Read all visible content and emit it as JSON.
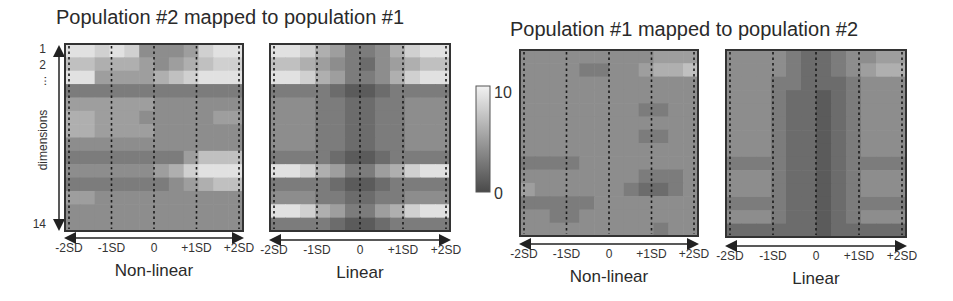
{
  "chart_data": [
    {
      "type": "heatmap",
      "group_title": "Population #2 mapped to population #1",
      "title": "Non-linear",
      "xlabel": "Non-linear",
      "ylabel": "dimensions",
      "x_tick_labels": [
        "-2SD",
        "-1SD",
        "0",
        "+1SD",
        "+2SD"
      ],
      "y_tick_labels": [
        "1",
        "2",
        "...",
        "14"
      ],
      "color_range": [
        0,
        10
      ],
      "rows": 14,
      "cols": 12,
      "values": [
        [
          9,
          9,
          8,
          9,
          8,
          4,
          4,
          4,
          5,
          8,
          9,
          9
        ],
        [
          7,
          7,
          6,
          6,
          6,
          5,
          4,
          5,
          6,
          7,
          8,
          8
        ],
        [
          9,
          9,
          5,
          5,
          5,
          5,
          6,
          7,
          8,
          9,
          9,
          9
        ],
        [
          3,
          3,
          3,
          3,
          3,
          3,
          3,
          3,
          3,
          3,
          3,
          3
        ],
        [
          5,
          5,
          5,
          5,
          5,
          5,
          4,
          4,
          4,
          4,
          4,
          4
        ],
        [
          6,
          6,
          5,
          5,
          5,
          4,
          4,
          4,
          4,
          4,
          5,
          5
        ],
        [
          6,
          6,
          5,
          5,
          5,
          5,
          4,
          4,
          4,
          4,
          4,
          4
        ],
        [
          4,
          4,
          4,
          4,
          4,
          4,
          4,
          4,
          4,
          4,
          4,
          4
        ],
        [
          3,
          3,
          3,
          3,
          3,
          3,
          3,
          3,
          5,
          7,
          7,
          7
        ],
        [
          4,
          4,
          4,
          4,
          4,
          4,
          5,
          6,
          8,
          9,
          9,
          9
        ],
        [
          3,
          3,
          3,
          3,
          3,
          3,
          3,
          4,
          5,
          6,
          7,
          7
        ],
        [
          5,
          5,
          4,
          4,
          4,
          4,
          4,
          4,
          4,
          4,
          4,
          4
        ],
        [
          4,
          4,
          4,
          4,
          4,
          4,
          4,
          4,
          4,
          4,
          4,
          4
        ],
        [
          4,
          4,
          4,
          4,
          4,
          4,
          4,
          4,
          4,
          4,
          4,
          4
        ]
      ]
    },
    {
      "type": "heatmap",
      "group_title": "Population #2 mapped to population #1",
      "title": "Linear",
      "xlabel": "Linear",
      "x_tick_labels": [
        "-2SD",
        "-1SD",
        "0",
        "+1SD",
        "+2SD"
      ],
      "color_range": [
        0,
        10
      ],
      "rows": 14,
      "cols": 12,
      "values": [
        [
          9,
          9,
          8,
          6,
          5,
          3,
          3,
          4,
          6,
          8,
          9,
          9
        ],
        [
          7,
          7,
          6,
          5,
          4,
          3,
          2,
          4,
          5,
          6,
          7,
          7
        ],
        [
          9,
          9,
          8,
          6,
          5,
          3,
          3,
          4,
          6,
          8,
          9,
          9
        ],
        [
          3,
          3,
          3,
          3,
          2,
          1,
          1,
          2,
          3,
          3,
          3,
          3
        ],
        [
          4,
          4,
          4,
          3,
          3,
          2,
          2,
          3,
          3,
          4,
          4,
          4
        ],
        [
          4,
          4,
          4,
          3,
          3,
          2,
          2,
          3,
          3,
          4,
          4,
          4
        ],
        [
          4,
          4,
          4,
          3,
          3,
          2,
          2,
          3,
          3,
          4,
          4,
          4
        ],
        [
          4,
          4,
          4,
          3,
          3,
          2,
          2,
          3,
          3,
          4,
          4,
          4
        ],
        [
          3,
          3,
          3,
          3,
          2,
          1,
          1,
          2,
          3,
          3,
          3,
          3
        ],
        [
          9,
          9,
          8,
          6,
          5,
          3,
          3,
          5,
          6,
          8,
          9,
          9
        ],
        [
          3,
          3,
          3,
          3,
          2,
          1,
          1,
          2,
          3,
          3,
          3,
          3
        ],
        [
          4,
          4,
          4,
          3,
          3,
          2,
          2,
          3,
          3,
          4,
          4,
          4
        ],
        [
          9,
          9,
          8,
          6,
          5,
          3,
          3,
          5,
          6,
          8,
          9,
          9
        ],
        [
          3,
          3,
          3,
          3,
          2,
          1,
          1,
          2,
          3,
          3,
          3,
          3
        ]
      ]
    },
    {
      "type": "heatmap",
      "group_title": "Population #1 mapped to population #2",
      "title": "Non-linear",
      "xlabel": "Non-linear",
      "x_tick_labels": [
        "-2SD",
        "-1SD",
        "0",
        "+1SD",
        "+2SD"
      ],
      "color_range": [
        0,
        10
      ],
      "rows": 14,
      "cols": 12,
      "values": [
        [
          4,
          4,
          4,
          4,
          4,
          4,
          4,
          4,
          4,
          5,
          5,
          5
        ],
        [
          4,
          4,
          4,
          4,
          3,
          3,
          4,
          4,
          5,
          6,
          6,
          7
        ],
        [
          4,
          4,
          4,
          4,
          4,
          4,
          4,
          4,
          4,
          4,
          4,
          4
        ],
        [
          4,
          4,
          4,
          4,
          4,
          4,
          4,
          4,
          4,
          4,
          4,
          4
        ],
        [
          4,
          4,
          4,
          4,
          4,
          4,
          4,
          4,
          3,
          3,
          4,
          4
        ],
        [
          4,
          4,
          4,
          4,
          4,
          4,
          4,
          4,
          4,
          4,
          4,
          4
        ],
        [
          4,
          4,
          4,
          4,
          4,
          4,
          4,
          4,
          3,
          3,
          4,
          4
        ],
        [
          4,
          4,
          4,
          4,
          4,
          4,
          4,
          4,
          4,
          4,
          4,
          4
        ],
        [
          3,
          3,
          3,
          3,
          4,
          4,
          4,
          4,
          4,
          4,
          4,
          4
        ],
        [
          4,
          4,
          4,
          4,
          4,
          4,
          4,
          4,
          3,
          3,
          3,
          4
        ],
        [
          5,
          4,
          4,
          4,
          4,
          4,
          4,
          3,
          2,
          2,
          3,
          4
        ],
        [
          3,
          3,
          3,
          3,
          3,
          4,
          4,
          4,
          4,
          4,
          4,
          4
        ],
        [
          4,
          4,
          3,
          3,
          4,
          4,
          4,
          4,
          4,
          4,
          4,
          4
        ],
        [
          4,
          4,
          4,
          4,
          4,
          4,
          4,
          4,
          4,
          3,
          4,
          4
        ]
      ]
    },
    {
      "type": "heatmap",
      "group_title": "Population #1 mapped to population #2",
      "title": "Linear",
      "xlabel": "Linear",
      "x_tick_labels": [
        "-2SD",
        "-1SD",
        "0",
        "+1SD",
        "+2SD"
      ],
      "color_range": [
        0,
        10
      ],
      "rows": 14,
      "cols": 12,
      "values": [
        [
          4,
          4,
          4,
          4,
          3,
          2,
          2,
          3,
          4,
          4,
          5,
          5
        ],
        [
          4,
          4,
          4,
          4,
          3,
          2,
          2,
          3,
          4,
          5,
          6,
          6
        ],
        [
          4,
          4,
          4,
          3,
          3,
          2,
          2,
          2,
          3,
          4,
          4,
          4
        ],
        [
          4,
          4,
          4,
          3,
          2,
          2,
          1,
          2,
          3,
          4,
          4,
          4
        ],
        [
          4,
          4,
          4,
          3,
          2,
          2,
          1,
          2,
          3,
          4,
          4,
          4
        ],
        [
          4,
          4,
          4,
          3,
          2,
          2,
          1,
          2,
          3,
          4,
          4,
          4
        ],
        [
          4,
          4,
          4,
          3,
          2,
          2,
          1,
          2,
          3,
          4,
          4,
          4
        ],
        [
          4,
          4,
          4,
          3,
          2,
          2,
          1,
          2,
          3,
          4,
          4,
          4
        ],
        [
          3,
          3,
          3,
          3,
          2,
          2,
          1,
          2,
          3,
          3,
          3,
          3
        ],
        [
          4,
          4,
          4,
          3,
          2,
          2,
          1,
          2,
          3,
          4,
          4,
          4
        ],
        [
          4,
          4,
          4,
          3,
          2,
          2,
          1,
          2,
          3,
          4,
          4,
          4
        ],
        [
          3,
          3,
          3,
          3,
          2,
          2,
          1,
          2,
          3,
          3,
          3,
          3
        ],
        [
          4,
          4,
          4,
          3,
          2,
          2,
          1,
          2,
          3,
          4,
          4,
          4
        ],
        [
          2,
          2,
          2,
          2,
          2,
          2,
          1,
          2,
          2,
          2,
          2,
          2
        ]
      ]
    }
  ],
  "titles": {
    "left": "Population #2 mapped to population #1",
    "right": "Population #1 mapped to population #2"
  },
  "y_axis": {
    "label": "dimensions",
    "ticks": [
      "1",
      "2",
      "...",
      "14"
    ]
  },
  "colorbar": {
    "max_label": "10",
    "min_label": "0",
    "range": [
      0,
      10
    ],
    "colors": {
      "low": "#4a4a4a",
      "high": "#f2f2f2"
    }
  }
}
